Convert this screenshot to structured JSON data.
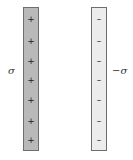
{
  "diagram": {
    "left_plate": {
      "label": "σ",
      "fill": "#b9b9b9",
      "signs": [
        "+",
        "+",
        "+",
        "+",
        "+",
        "+",
        "+"
      ],
      "sign_y": [
        11,
        33,
        53,
        72,
        92,
        113,
        132
      ]
    },
    "right_plate": {
      "label": "−σ",
      "fill": "#ececec",
      "signs": [
        "–",
        "–",
        "–",
        "–",
        "–",
        "–",
        "–"
      ],
      "sign_y": [
        11,
        33,
        53,
        72,
        92,
        113,
        132
      ]
    }
  }
}
